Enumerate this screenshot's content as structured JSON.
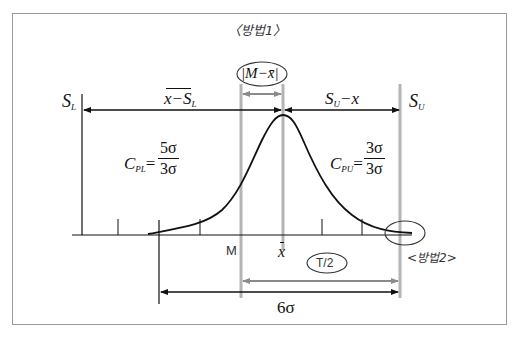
{
  "diagram": {
    "title_method1": "〈방법1〉",
    "label_method2": "<방법2>",
    "spec_lower": {
      "symbol": "S",
      "subscript": "L"
    },
    "spec_upper": {
      "symbol": "S",
      "subscript": "U"
    },
    "dist_left": {
      "text": "x−S",
      "subscript": "L"
    },
    "dist_right": {
      "text": "S",
      "subscript": "U",
      "suffix": "−x"
    },
    "offset_label": "|M−x̄|",
    "cpl": {
      "symbol": "C",
      "subscript": "PL",
      "eq": "=",
      "numerator": "5σ",
      "denominator": "3σ"
    },
    "cpu": {
      "symbol": "C",
      "subscript": "PU",
      "eq": "=",
      "numerator": "3σ",
      "denominator": "3σ"
    },
    "axis_M": "M",
    "axis_xbar": "x",
    "half_tolerance": "T/2",
    "six_sigma": "6σ",
    "colors": {
      "frame": "#9a9a9a",
      "curve": "#111111",
      "guide_grey": "#b4b4b4",
      "grey_arrow": "#8a8a8a",
      "black": "#111111"
    }
  }
}
